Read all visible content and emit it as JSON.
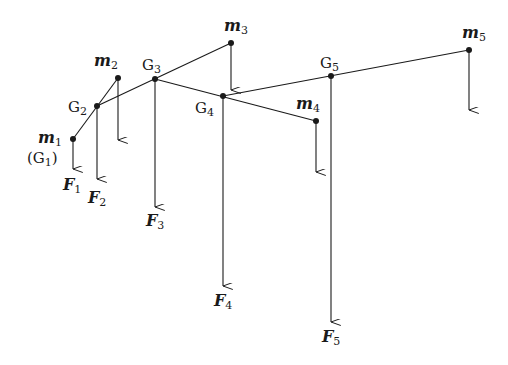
{
  "diagram": {
    "colors": {
      "line": "#1a1a1a",
      "background": "#ffffff"
    },
    "points": [
      {
        "id": "m1",
        "x": 73,
        "y": 139,
        "label": "m",
        "sub": "1",
        "extra": "(G",
        "extra_sub": "1",
        "extra_close": ")"
      },
      {
        "id": "m2",
        "x": 118,
        "y": 78,
        "label": "m",
        "sub": "2"
      },
      {
        "id": "m3",
        "x": 231,
        "y": 43,
        "label": "m",
        "sub": "3"
      },
      {
        "id": "m4",
        "x": 316,
        "y": 121,
        "label": "m",
        "sub": "4"
      },
      {
        "id": "m5",
        "x": 469,
        "y": 50,
        "label": "m",
        "sub": "5"
      },
      {
        "id": "G2",
        "x": 97,
        "y": 106,
        "label": "G",
        "sub": "2"
      },
      {
        "id": "G3",
        "x": 155,
        "y": 79,
        "label": "G",
        "sub": "3"
      },
      {
        "id": "G4",
        "x": 223,
        "y": 96,
        "label": "G",
        "sub": "4"
      },
      {
        "id": "G5",
        "x": 331,
        "y": 76,
        "label": "G",
        "sub": "5"
      }
    ],
    "forces": [
      {
        "id": "F1",
        "label": "F",
        "sub": "1"
      },
      {
        "id": "F2",
        "label": "F",
        "sub": "2"
      },
      {
        "id": "F3",
        "label": "F",
        "sub": "3"
      },
      {
        "id": "F4",
        "label": "F",
        "sub": "4"
      },
      {
        "id": "F5",
        "label": "F",
        "sub": "5"
      }
    ]
  }
}
